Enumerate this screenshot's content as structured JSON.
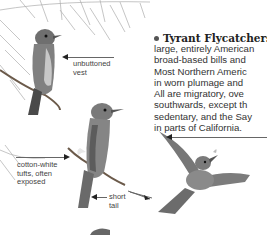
{
  "section": {
    "heading": "Tyrant Flycatchers",
    "body_lines": [
      "large, entirely American",
      "broad-based bills and",
      "Most Northern Americ",
      "in worn plumage and",
      "All are migratory, ove",
      "southwards, except th",
      "sedentary, and the Say",
      "in parts of California."
    ]
  },
  "annotations": {
    "vest": [
      "unbuttoned",
      "vest"
    ],
    "tufts": [
      "cotton-white",
      "tufts, often",
      "exposed"
    ],
    "tail": [
      "short",
      "tail"
    ]
  },
  "illustrations": {
    "bird_top": "perched-flycatcher",
    "bird_middle": "perched-flycatcher",
    "bird_flight": "flycatcher-in-flight"
  },
  "colors": {
    "text": "#333333",
    "bird_gray": "#7a7a7a"
  }
}
